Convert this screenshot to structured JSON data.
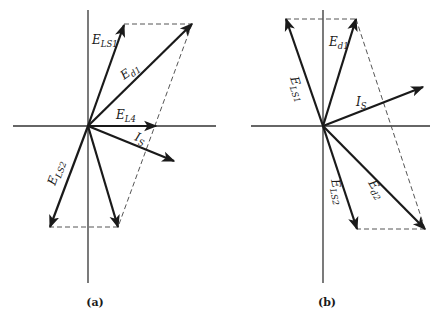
{
  "figure": {
    "colors": {
      "ink": "#1a1a1a",
      "axis": "#333333",
      "dash": "#555555",
      "background": "#ffffff"
    },
    "panels": [
      {
        "id": "a",
        "caption": "(a)",
        "origin": [
          88,
          126
        ],
        "axes": {
          "h": [
            13,
            126,
            216,
            126
          ],
          "v": [
            88,
            10,
            88,
            283
          ]
        },
        "dashed": [
          [
            124,
            24,
            192,
            24
          ],
          [
            192,
            24,
            118,
            227
          ],
          [
            118,
            227,
            50,
            227
          ]
        ],
        "phasors": [
          {
            "name": "E_LS1",
            "to": [
              124,
              25
            ]
          },
          {
            "name": "E_d1",
            "to": [
              192,
              24
            ]
          },
          {
            "name": "E_L4",
            "to": [
              156,
              126
            ]
          },
          {
            "name": "I_S",
            "to": [
              174,
              161
            ]
          },
          {
            "name": "E_LS2",
            "to": [
              50,
              227
            ]
          },
          {
            "name": "E_d2",
            "to": [
              118,
              227
            ]
          }
        ],
        "labels": [
          {
            "main": "E",
            "sub": "LS1",
            "x": 92,
            "y": 44,
            "rot": 0
          },
          {
            "main": "E",
            "sub": "d1",
            "x": 124,
            "y": 80,
            "rot": -36
          },
          {
            "main": "E",
            "sub": "L4",
            "x": 116,
            "y": 119,
            "rot": 0
          },
          {
            "main": "I",
            "sub": "S",
            "x": 134,
            "y": 140,
            "rot": 20
          },
          {
            "main": "E",
            "sub": "LS2",
            "x": 55,
            "y": 186,
            "rot": -70
          }
        ],
        "caption_pos": [
          95,
          306
        ]
      },
      {
        "id": "b",
        "caption": "(b)",
        "origin": [
          323,
          126
        ],
        "axes": {
          "h": [
            251,
            126,
            430,
            126
          ],
          "v": [
            323,
            10,
            323,
            283
          ]
        },
        "dashed": [
          [
            286,
            19,
            356,
            19
          ],
          [
            356,
            19,
            425,
            229
          ],
          [
            425,
            229,
            357,
            229
          ]
        ],
        "phasors": [
          {
            "name": "E_LS1",
            "to": [
              286,
              19
            ]
          },
          {
            "name": "E_d1",
            "to": [
              356,
              19
            ]
          },
          {
            "name": "I_S",
            "to": [
              423,
              87
            ]
          },
          {
            "name": "E_LS2",
            "to": [
              357,
              229
            ]
          },
          {
            "name": "E_d2",
            "to": [
              425,
              229
            ]
          }
        ],
        "labels": [
          {
            "main": "E",
            "sub": "d1",
            "x": 329,
            "y": 46,
            "rot": 0
          },
          {
            "main": "E",
            "sub": "LS1",
            "x": 290,
            "y": 78,
            "rot": 72
          },
          {
            "main": "I",
            "sub": "S",
            "x": 356,
            "y": 106,
            "rot": 0
          },
          {
            "main": "E",
            "sub": "LS2",
            "x": 331,
            "y": 180,
            "rot": 78
          },
          {
            "main": "E",
            "sub": "d2",
            "x": 368,
            "y": 183,
            "rot": 58
          }
        ],
        "caption_pos": [
          327,
          306
        ]
      }
    ]
  }
}
